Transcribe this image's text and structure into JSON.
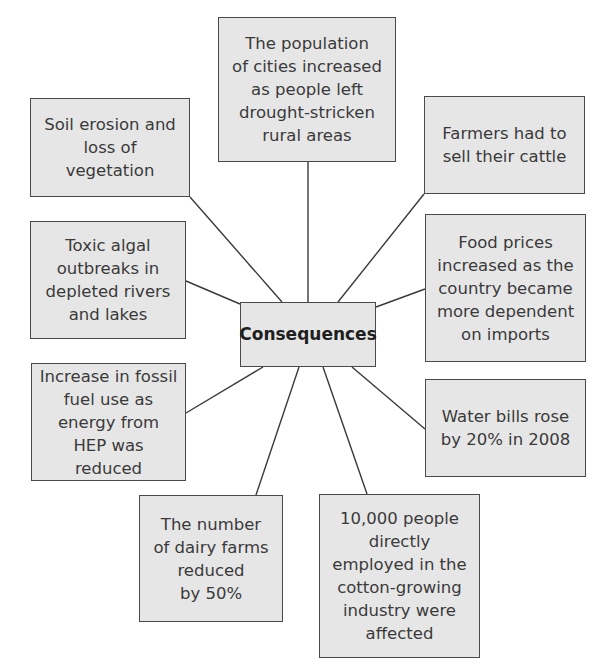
{
  "diagram": {
    "center": {
      "label": "Consequences"
    },
    "nodes": [
      {
        "id": "cities",
        "text": "The population\nof cities increased\nas people left\ndrought-stricken\nrural areas"
      },
      {
        "id": "soil",
        "text": "Soil erosion and\nloss of vegetation"
      },
      {
        "id": "cattle",
        "text": "Farmers had to\nsell their cattle"
      },
      {
        "id": "algal",
        "text": "Toxic algal\noutbreaks in\ndepleted rivers\nand lakes"
      },
      {
        "id": "food",
        "text": "Food prices\nincreased as the\ncountry became\nmore dependent\non imports"
      },
      {
        "id": "fossil",
        "text": "Increase in fossil\nfuel use as\nenergy from\nHEP was reduced"
      },
      {
        "id": "water",
        "text": "Water bills rose\nby 20% in 2008"
      },
      {
        "id": "dairy",
        "text": "The number\nof dairy farms\nreduced\nby 50%"
      },
      {
        "id": "cotton",
        "text": "10,000 people\ndirectly\nemployed in the\ncotton-growing\nindustry were\naffected"
      }
    ],
    "edges": [
      {
        "from": "center",
        "to": "cities"
      },
      {
        "from": "center",
        "to": "soil"
      },
      {
        "from": "center",
        "to": "cattle"
      },
      {
        "from": "center",
        "to": "algal"
      },
      {
        "from": "center",
        "to": "food"
      },
      {
        "from": "center",
        "to": "fossil"
      },
      {
        "from": "center",
        "to": "water"
      },
      {
        "from": "center",
        "to": "dairy"
      },
      {
        "from": "center",
        "to": "cotton"
      }
    ]
  }
}
